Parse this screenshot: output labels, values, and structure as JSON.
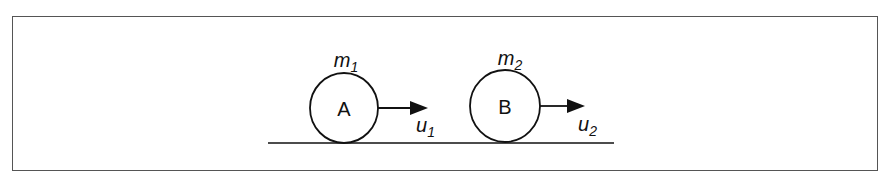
{
  "diagram": {
    "bodies": [
      {
        "label": "A",
        "mass": "m",
        "mass_sub": "1",
        "velocity": "u",
        "velocity_sub": "1"
      },
      {
        "label": "B",
        "mass": "m",
        "mass_sub": "2",
        "velocity": "u",
        "velocity_sub": "2"
      }
    ],
    "colors": {
      "stroke": "#111111",
      "frame": "#555555",
      "background": "#ffffff"
    }
  }
}
